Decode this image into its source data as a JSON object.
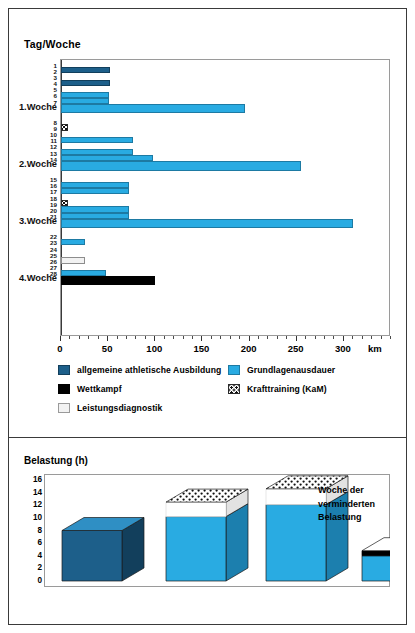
{
  "top_chart": {
    "axis_title": "Tag/Woche",
    "x_unit": "km",
    "x_ticks": [
      0,
      50,
      100,
      150,
      200,
      250,
      300
    ],
    "x_minor_step": 10,
    "x_max": 350,
    "rows": [
      {
        "label": "1",
        "type": "day",
        "value": 0,
        "category": null
      },
      {
        "label": "2",
        "type": "day",
        "value": 52,
        "category": "gla"
      },
      {
        "label": "3",
        "type": "day",
        "value": 0,
        "category": null
      },
      {
        "label": "4",
        "type": "day",
        "value": 52,
        "category": "gla"
      },
      {
        "label": "5",
        "type": "day",
        "value": 0,
        "category": null
      },
      {
        "label": "6",
        "type": "day",
        "value": 51,
        "category": "gau"
      },
      {
        "label": "7",
        "type": "day",
        "value": 51,
        "category": "gau"
      },
      {
        "label": "1.Woche",
        "type": "week",
        "value": 195,
        "category": "gau"
      },
      {
        "label": "8",
        "type": "day",
        "value": 0,
        "category": null
      },
      {
        "label": "9",
        "type": "day",
        "value": 6,
        "category": "kt"
      },
      {
        "label": "10",
        "type": "day",
        "value": 0,
        "category": null
      },
      {
        "label": "11",
        "type": "day",
        "value": 76,
        "category": "gau"
      },
      {
        "label": "12",
        "type": "day",
        "value": 0,
        "category": null
      },
      {
        "label": "13",
        "type": "day",
        "value": 76,
        "category": "gau"
      },
      {
        "label": "14",
        "type": "day",
        "value": 98,
        "category": "gau"
      },
      {
        "label": "2.Woche",
        "type": "week",
        "value": 255,
        "category": "gau"
      },
      {
        "label": "15",
        "type": "day",
        "value": 0,
        "category": null
      },
      {
        "label": "16",
        "type": "day",
        "value": 72,
        "category": "gau"
      },
      {
        "label": "17",
        "type": "day",
        "value": 72,
        "category": "gau"
      },
      {
        "label": "18",
        "type": "day",
        "value": 0,
        "category": null
      },
      {
        "label": "19",
        "type": "day",
        "value": 6,
        "category": "kt"
      },
      {
        "label": "20",
        "type": "day",
        "value": 72,
        "category": "gau"
      },
      {
        "label": "21",
        "type": "day",
        "value": 72,
        "category": "gau"
      },
      {
        "label": "3.Woche",
        "type": "week",
        "value": 310,
        "category": "gau"
      },
      {
        "label": "22",
        "type": "day",
        "value": 0,
        "category": null
      },
      {
        "label": "23",
        "type": "day",
        "value": 25,
        "category": "gau"
      },
      {
        "label": "24",
        "type": "day",
        "value": 0,
        "category": null
      },
      {
        "label": "25",
        "type": "day",
        "value": 0,
        "category": null
      },
      {
        "label": "26",
        "type": "day",
        "value": 25,
        "category": "ld"
      },
      {
        "label": "27",
        "type": "day",
        "value": 0,
        "category": null
      },
      {
        "label": "28",
        "type": "day",
        "value": 48,
        "category": "gau"
      },
      {
        "label": "4.Woche",
        "type": "week",
        "value": 100,
        "category": "wk"
      }
    ]
  },
  "legend": {
    "items": [
      {
        "key": "gla",
        "label": "allgemeine athletische Ausbildung",
        "color": "#1d5f8a"
      },
      {
        "key": "gau",
        "label": "Grundlagenausdauer",
        "color": "#29abe2"
      },
      {
        "key": "wk",
        "label": "Wettkampf",
        "color": "#000000"
      },
      {
        "key": "kt",
        "label": "Krafttraining (KaM)",
        "color": "#ffffff"
      },
      {
        "key": "ld",
        "label": "Leistungsdiagnostik",
        "color": "#f2f2f2"
      }
    ]
  },
  "bottom_chart": {
    "axis_title": "Belastung (h)",
    "y_ticks": [
      0,
      2,
      4,
      6,
      8,
      10,
      12,
      14,
      16
    ],
    "y_max": 16,
    "note": "Woche der verminderten Belastung",
    "bars": [
      {
        "label": "1.Woche",
        "base": 8.0,
        "base_fill": "gla",
        "cap": null,
        "cap_top": null
      },
      {
        "label": "2.Woche",
        "base": 10.2,
        "base_fill": "gau",
        "cap": "kt",
        "cap_top": 12.5
      },
      {
        "label": "3.Woche",
        "base": 12.1,
        "base_fill": "gau",
        "cap": "kt",
        "cap_top": 14.6
      },
      {
        "label": "4.Woche",
        "base": 4.0,
        "base_fill": "gau",
        "cap": "wk",
        "cap_top": 4.8
      }
    ]
  },
  "chart_data": [
    {
      "type": "bar",
      "orientation": "horizontal",
      "title": "Tag/Woche",
      "xlabel": "km",
      "ylabel": "Tag/Woche",
      "xlim": [
        0,
        350
      ],
      "xticks": [
        0,
        50,
        100,
        150,
        200,
        250,
        300
      ],
      "grid": false,
      "legend": [
        "allgemeine athletische Ausbildung",
        "Grundlagenausdauer",
        "Wettkampf",
        "Krafttraining (KaM)",
        "Leistungsdiagnostik"
      ],
      "legend_position": "below-axes",
      "categories": [
        "1",
        "2",
        "3",
        "4",
        "5",
        "6",
        "7",
        "1.Woche",
        "8",
        "9",
        "10",
        "11",
        "12",
        "13",
        "14",
        "2.Woche",
        "15",
        "16",
        "17",
        "18",
        "19",
        "20",
        "21",
        "3.Woche",
        "22",
        "23",
        "24",
        "25",
        "26",
        "27",
        "28",
        "4.Woche"
      ],
      "values": [
        0,
        52,
        0,
        52,
        0,
        51,
        51,
        195,
        0,
        6,
        0,
        76,
        0,
        76,
        98,
        255,
        0,
        72,
        72,
        0,
        6,
        72,
        72,
        310,
        0,
        25,
        0,
        0,
        25,
        0,
        48,
        100
      ],
      "value_categories": [
        null,
        "allgemeine athletische Ausbildung",
        null,
        "allgemeine athletische Ausbildung",
        null,
        "Grundlagenausdauer",
        "Grundlagenausdauer",
        "Grundlagenausdauer",
        null,
        "Krafttraining (KaM)",
        null,
        "Grundlagenausdauer",
        null,
        "Grundlagenausdauer",
        "Grundlagenausdauer",
        "Grundlagenausdauer",
        null,
        "Grundlagenausdauer",
        "Grundlagenausdauer",
        null,
        "Krafttraining (KaM)",
        "Grundlagenausdauer",
        "Grundlagenausdauer",
        "Grundlagenausdauer",
        null,
        "Grundlagenausdauer",
        null,
        null,
        "Leistungsdiagnostik",
        null,
        "Grundlagenausdauer",
        "Wettkampf"
      ]
    },
    {
      "type": "bar",
      "orientation": "vertical",
      "title": "Belastung (h)",
      "xlabel": "",
      "ylabel": "Belastung (h)",
      "ylim": [
        0,
        16
      ],
      "yticks": [
        0,
        2,
        4,
        6,
        8,
        10,
        12,
        14,
        16
      ],
      "grid": false,
      "categories": [
        "1.Woche",
        "2.Woche",
        "3.Woche",
        "4.Woche"
      ],
      "values": [
        8.0,
        12.5,
        14.6,
        4.8
      ],
      "series": [
        {
          "name": "Grundbelastung",
          "values": [
            8.0,
            10.2,
            12.1,
            4.0
          ]
        },
        {
          "name": "Zusatz (Krafttraining / Wettkampf)",
          "values": [
            0,
            2.3,
            2.5,
            0.8
          ]
        }
      ],
      "annotations": [
        "Woche der verminderten Belastung"
      ]
    }
  ]
}
